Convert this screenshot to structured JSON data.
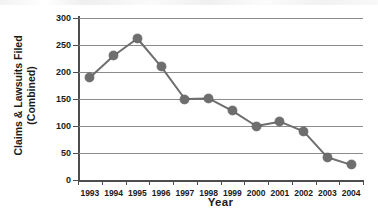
{
  "chart_data": {
    "type": "line",
    "title": "",
    "xlabel": "Year",
    "ylabel": "Claims & Lawsuits Filed (Combined)",
    "ylabel_line1": "Claims & Lawsuits Filed",
    "ylabel_line2": "(Combined)",
    "categories": [
      "1993",
      "1994",
      "1995",
      "1996",
      "1997",
      "1998",
      "1999",
      "2000",
      "2001",
      "2002",
      "2003",
      "2004"
    ],
    "values": [
      190,
      230,
      262,
      210,
      150,
      151,
      128,
      100,
      108,
      90,
      42,
      28
    ],
    "series": [
      {
        "name": "Claims & Lawsuits Filed (Combined)",
        "values": [
          190,
          230,
          262,
          210,
          150,
          151,
          128,
          100,
          108,
          90,
          42,
          28
        ]
      }
    ],
    "ylim": [
      0,
      300
    ],
    "yticks": [
      0,
      50,
      100,
      150,
      200,
      250,
      300
    ],
    "ytick_labels": [
      "0",
      "50",
      "100",
      "150",
      "200",
      "250",
      "300"
    ],
    "grid": true,
    "grid_axis": "y",
    "legend": false,
    "legend_position": "none",
    "marker": "circle",
    "marker_color": "#6e6e6e",
    "line_color": "#6e6e6e",
    "axis_color": "#4d4d4d",
    "gridline_color": "#8c8c8c",
    "background": "#ffffff",
    "annotations": []
  }
}
